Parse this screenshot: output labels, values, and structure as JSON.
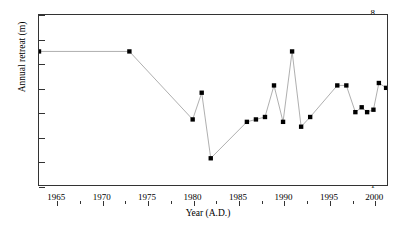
{
  "chart_data": {
    "type": "line",
    "title": "",
    "xlabel": "Year (A.D.)",
    "ylabel": "Annual retreat (m)",
    "xlim": [
      1963,
      2001.5
    ],
    "ylim": [
      1,
      8
    ],
    "grid": false,
    "legend": null,
    "marker": "filled-square",
    "line_color": "#9a9a9a",
    "marker_color": "#000000",
    "x_ticks": [
      1965,
      1970,
      1975,
      1980,
      1985,
      1990,
      1995,
      2000
    ],
    "x_tick_labels": [
      "1965",
      "1970",
      "1975",
      "1980",
      "1985",
      "1990",
      "1995",
      "2000"
    ],
    "x_minor_ticks": [
      1967.5,
      1972.5,
      1977.5,
      1982.5,
      1987.5,
      1992.5,
      1997.5
    ],
    "y_ticks": [
      1,
      2,
      3,
      4,
      5,
      6,
      7,
      8
    ],
    "y_tick_labels": [
      "1",
      "2",
      "3",
      "4",
      "5",
      "6",
      "7",
      "8"
    ],
    "x": [
      1963.0,
      1973.0,
      1980.0,
      1981.0,
      1982.0,
      1986.0,
      1987.0,
      1988.0,
      1989.0,
      1990.0,
      1991.0,
      1992.0,
      1993.0,
      1996.0,
      1997.0,
      1998.0,
      1998.7,
      1999.3,
      2000.0,
      2000.6,
      2001.4
    ],
    "values": [
      6.5,
      6.5,
      3.7,
      4.8,
      2.1,
      3.6,
      3.7,
      3.8,
      5.1,
      3.6,
      6.5,
      3.4,
      3.8,
      5.1,
      5.1,
      4.0,
      4.2,
      4.0,
      4.1,
      5.2,
      5.0
    ],
    "points": [
      {
        "year": 1963.0,
        "retreat": 6.5
      },
      {
        "year": 1973.0,
        "retreat": 6.5
      },
      {
        "year": 1980.0,
        "retreat": 3.7
      },
      {
        "year": 1981.0,
        "retreat": 4.8
      },
      {
        "year": 1982.0,
        "retreat": 2.1
      },
      {
        "year": 1986.0,
        "retreat": 3.6
      },
      {
        "year": 1987.0,
        "retreat": 3.7
      },
      {
        "year": 1988.0,
        "retreat": 3.8
      },
      {
        "year": 1989.0,
        "retreat": 5.1
      },
      {
        "year": 1990.0,
        "retreat": 3.6
      },
      {
        "year": 1991.0,
        "retreat": 6.5
      },
      {
        "year": 1992.0,
        "retreat": 3.4
      },
      {
        "year": 1993.0,
        "retreat": 3.8
      },
      {
        "year": 1996.0,
        "retreat": 5.1
      },
      {
        "year": 1997.0,
        "retreat": 5.1
      },
      {
        "year": 1998.0,
        "retreat": 4.0
      },
      {
        "year": 1998.7,
        "retreat": 4.2
      },
      {
        "year": 1999.3,
        "retreat": 4.0
      },
      {
        "year": 2000.0,
        "retreat": 4.1
      },
      {
        "year": 2000.6,
        "retreat": 5.2
      },
      {
        "year": 2001.4,
        "retreat": 5.0
      }
    ]
  }
}
